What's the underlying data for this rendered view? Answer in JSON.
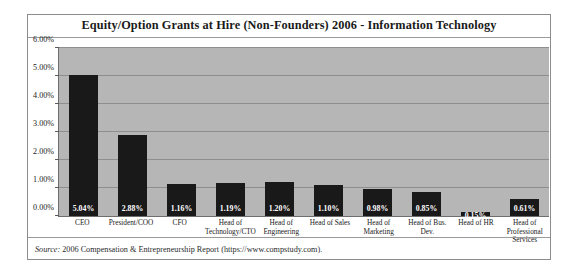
{
  "chart_data": {
    "type": "bar",
    "title": "Equity/Option Grants at Hire (Non-Founders) 2006 - Information Technology",
    "xlabel": "",
    "ylabel": "",
    "ylim": [
      0,
      6
    ],
    "ytick_labels": [
      "0.00%",
      "1.00%",
      "2.00%",
      "3.00%",
      "4.00%",
      "5.00%",
      "6.00%"
    ],
    "ytick_values": [
      0,
      1,
      2,
      3,
      4,
      5,
      6
    ],
    "grid": true,
    "legend": "none",
    "categories": [
      "CEO",
      "President/COO",
      "CFO",
      "Head of Technology/CTO",
      "Head of Engineering",
      "Head of Sales",
      "Head of Marketing",
      "Head of Bus. Dev.",
      "Head of HR",
      "Head of Professional Services"
    ],
    "values": [
      5.04,
      2.88,
      1.16,
      1.19,
      1.2,
      1.1,
      0.98,
      0.85,
      0.15,
      0.61
    ],
    "data_labels": [
      "5.04%",
      "2.88%",
      "1.16%",
      "1.19%",
      "1.20%",
      "1.10%",
      "0.98%",
      "0.85%",
      "0.15%",
      "0.61%"
    ],
    "bar_color": "#191919",
    "plot_background": "#b6b6b6",
    "gridline_color": "#8e8e8e"
  },
  "footer": {
    "source_label": "Source:",
    "source_text": " 2006 Compensation & Entrepreneurship Report (https://www.compstudy.com)."
  }
}
